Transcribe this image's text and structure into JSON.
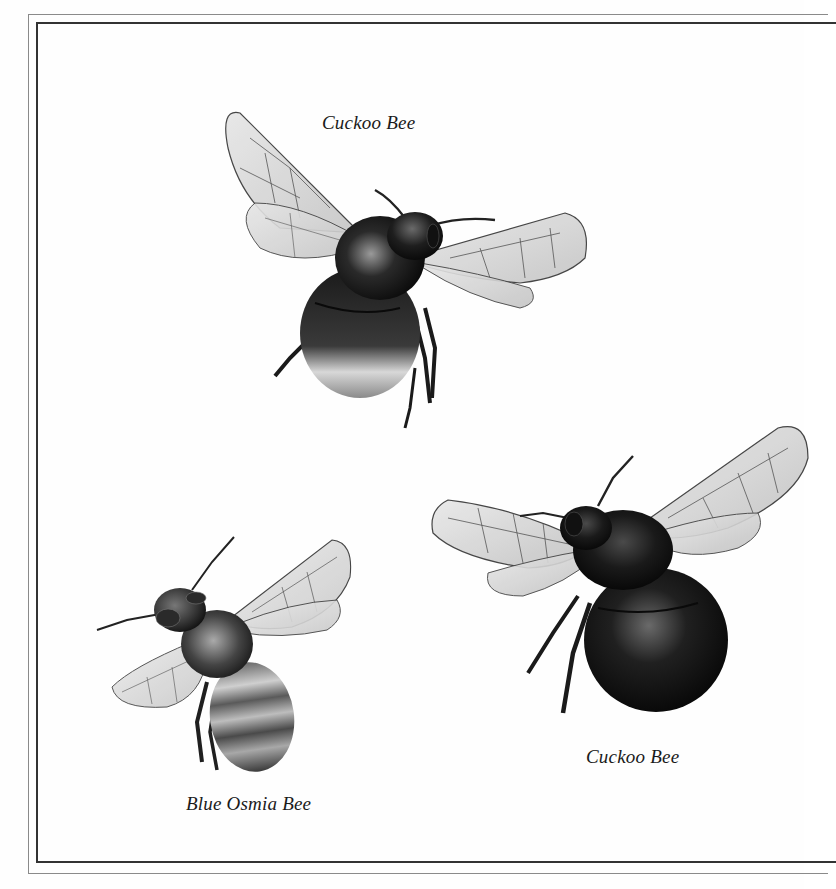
{
  "plate": {
    "background_color": "#fefefe",
    "frame": {
      "outer_line_color": "#8a8a8a",
      "inner_line_color": "#333333"
    }
  },
  "illustrations": [
    {
      "id": "bee-top",
      "caption": "Cuckoo Bee",
      "position": "top-center"
    },
    {
      "id": "bee-bottom-left",
      "caption": "Blue Osmia Bee",
      "position": "bottom-left"
    },
    {
      "id": "bee-bottom-right",
      "caption": "Cuckoo Bee",
      "position": "bottom-right"
    }
  ],
  "icons": {
    "bee_top": "cuckoo-bee-illustration",
    "bee_bottom_left": "blue-osmia-bee-illustration",
    "bee_bottom_right": "cuckoo-bee-illustration"
  }
}
